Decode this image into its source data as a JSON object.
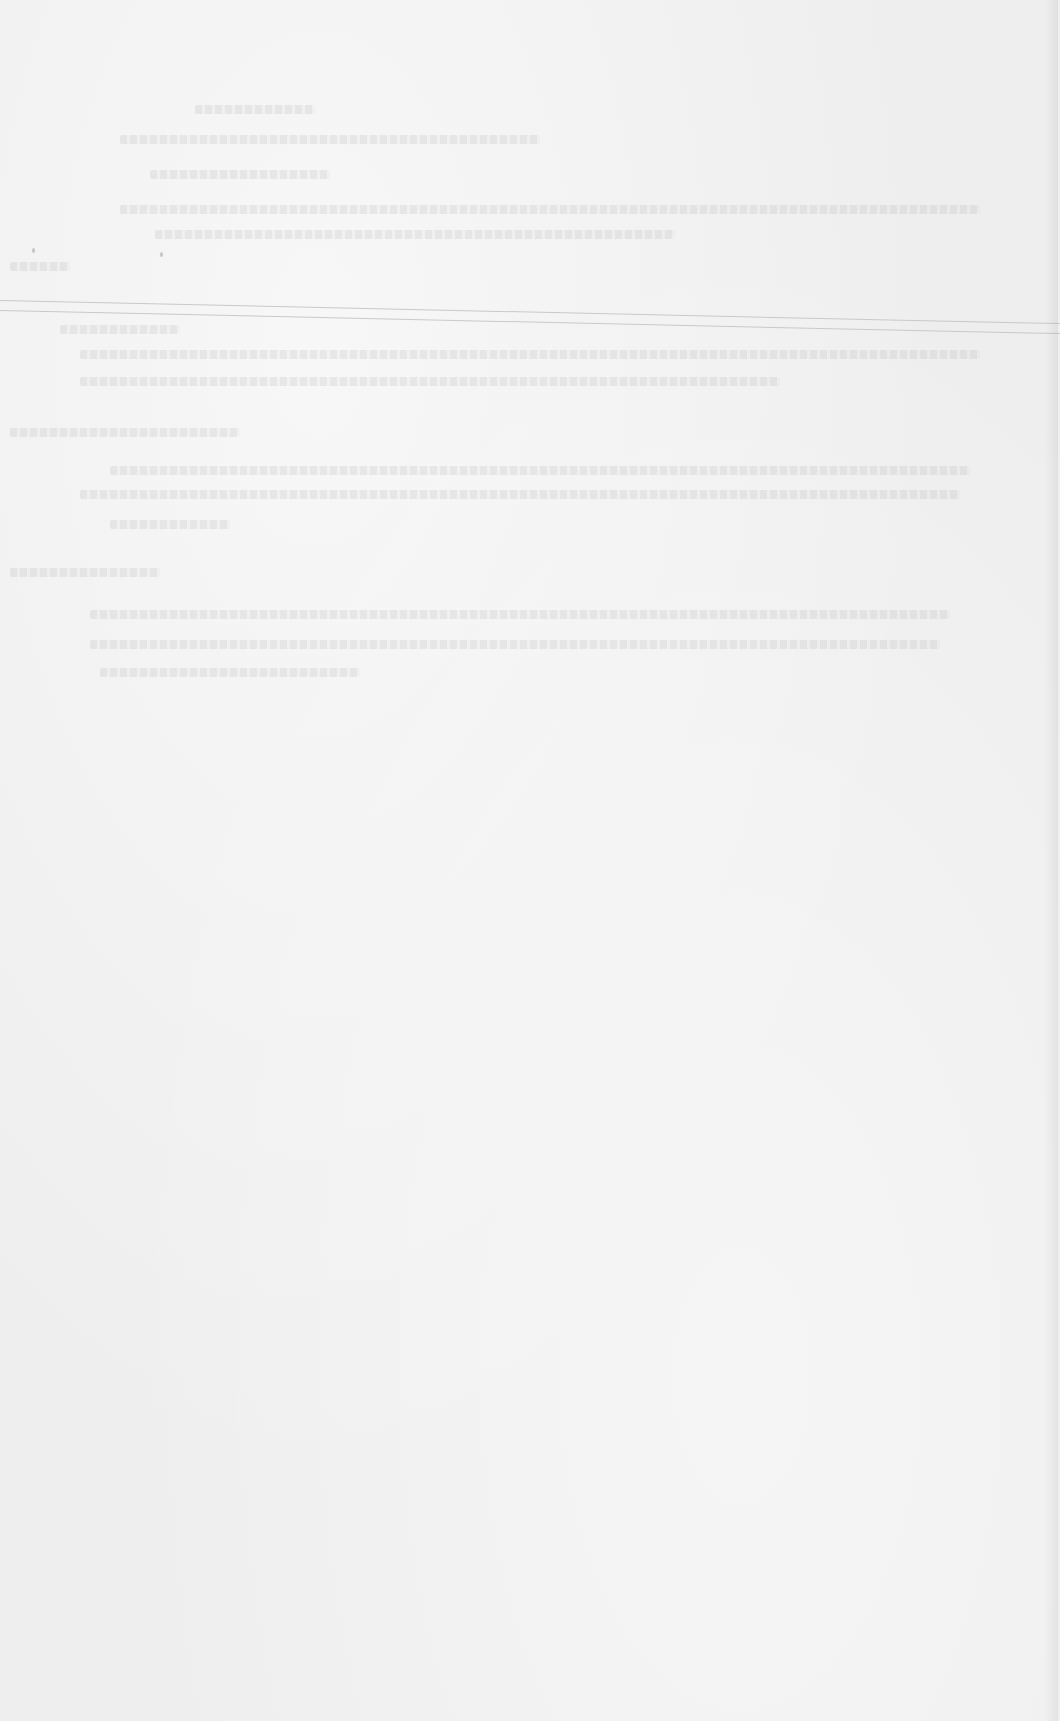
{
  "document": {
    "type": "scanned paper page",
    "legible_text": [],
    "paper_color": "#eeeeee",
    "rule_color": "#c9c9c9"
  },
  "ghost_text_lines": [
    {
      "left": 195,
      "top": 105,
      "width": 120
    },
    {
      "left": 120,
      "top": 135,
      "width": 420
    },
    {
      "left": 150,
      "top": 170,
      "width": 180
    },
    {
      "left": 120,
      "top": 205,
      "width": 860
    },
    {
      "left": 155,
      "top": 230,
      "width": 520
    },
    {
      "left": 10,
      "top": 262,
      "width": 60
    },
    {
      "left": 60,
      "top": 325,
      "width": 120
    },
    {
      "left": 80,
      "top": 350,
      "width": 900
    },
    {
      "left": 80,
      "top": 377,
      "width": 700
    },
    {
      "left": 10,
      "top": 428,
      "width": 230
    },
    {
      "left": 110,
      "top": 466,
      "width": 860
    },
    {
      "left": 80,
      "top": 490,
      "width": 880
    },
    {
      "left": 110,
      "top": 520,
      "width": 120
    },
    {
      "left": 10,
      "top": 568,
      "width": 150
    },
    {
      "left": 90,
      "top": 610,
      "width": 860
    },
    {
      "left": 90,
      "top": 640,
      "width": 850
    },
    {
      "left": 100,
      "top": 668,
      "width": 260
    }
  ]
}
